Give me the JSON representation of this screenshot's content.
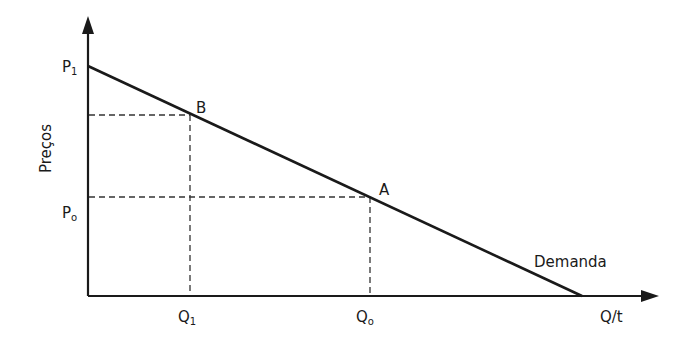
{
  "diagram": {
    "type": "demand-curve",
    "axes": {
      "y_label": "Preços",
      "x_label": "Q/t"
    },
    "curve": {
      "label": "Demanda",
      "start": {
        "label": "P₁"
      },
      "color": "#1a1a1a"
    },
    "points": [
      {
        "name": "B",
        "price_label": "P₁",
        "price_label_base": "P",
        "price_sub": "1"
      },
      {
        "name": "A",
        "price_label": "Pₒ",
        "price_label_base": "P",
        "price_sub": "o"
      }
    ],
    "labels": {
      "p1_base": "P",
      "p1_sub": "1",
      "p0_base": "P",
      "p0_sub": "o",
      "q1_base": "Q",
      "q1_sub": "1",
      "q0_base": "Q",
      "q0_sub": "o",
      "point_b": "B",
      "point_a": "A",
      "demand": "Demanda",
      "y_axis": "Preços",
      "x_axis": "Q/t"
    },
    "colors": {
      "line": "#1a1a1a",
      "dashed": "#333333",
      "background": "#ffffff"
    }
  }
}
